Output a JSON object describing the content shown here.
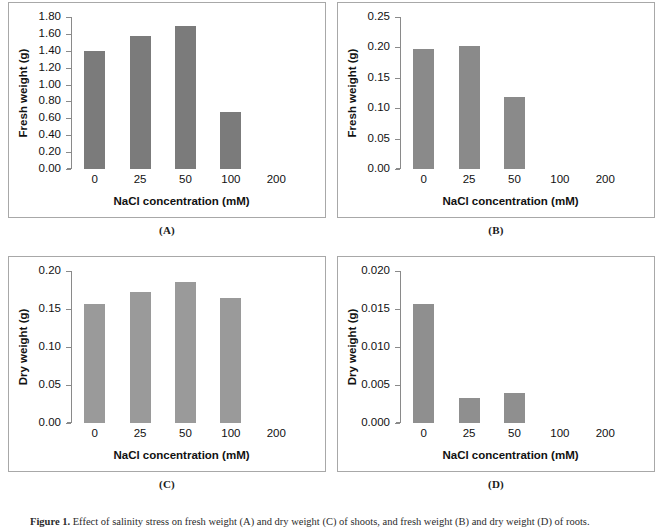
{
  "figure": {
    "caption_prefix": "Figure 1.",
    "caption_text": " Effect of salinity stress on fresh weight (A) and dry weight (C) of shoots, and fresh weight (B) and dry weight (D) of roots."
  },
  "common": {
    "xlabel": "NaCl concentration (mM)",
    "categories": [
      "0",
      "25",
      "50",
      "100",
      "200"
    ],
    "bar_color_dark": "#7b7b7b",
    "bar_color_light": "#9a9a9a",
    "axis_color": "#8a8a8a",
    "frame_color": "#a8a8a8"
  },
  "panels": [
    {
      "key": "A",
      "label": "(A)",
      "ylabel": "Fresh weight (g)",
      "yticks": [
        "0.00",
        "0.20",
        "0.40",
        "0.60",
        "0.80",
        "1.00",
        "1.20",
        "1.40",
        "1.60",
        "1.80"
      ],
      "ymin": 0,
      "ymax": 1.8,
      "bar_color": "#7b7b7b",
      "values": [
        1.4,
        1.58,
        1.69,
        0.68,
        null
      ]
    },
    {
      "key": "B",
      "label": "(B)",
      "ylabel": "Fresh weight (g)",
      "yticks": [
        "0.00",
        "0.05",
        "0.10",
        "0.15",
        "0.20",
        "0.25"
      ],
      "ymin": 0,
      "ymax": 0.25,
      "bar_color": "#8a8a8a",
      "values": [
        0.198,
        0.203,
        0.119,
        null,
        null
      ]
    },
    {
      "key": "C",
      "label": "(C)",
      "ylabel": "Dry weight (g)",
      "yticks": [
        "0.00",
        "0.05",
        "0.10",
        "0.15",
        "0.20"
      ],
      "ymin": 0,
      "ymax": 0.2,
      "bar_color": "#9a9a9a",
      "values": [
        0.156,
        0.172,
        0.186,
        0.165,
        null
      ]
    },
    {
      "key": "D",
      "label": "(D)",
      "ylabel": "Dry weight (g)",
      "yticks": [
        "0.000",
        "0.005",
        "0.010",
        "0.015",
        "0.020"
      ],
      "ymin": 0,
      "ymax": 0.02,
      "bar_color": "#8f8f8f",
      "values": [
        0.0156,
        0.0033,
        0.0039,
        null,
        null
      ]
    }
  ],
  "chart_data": [
    {
      "type": "bar",
      "panel": "A",
      "title": "(A)",
      "categories": [
        "0",
        "25",
        "50",
        "100",
        "200"
      ],
      "values": [
        1.4,
        1.58,
        1.69,
        0.68,
        null
      ],
      "xlabel": "NaCl concentration (mM)",
      "ylabel": "Fresh weight (g)",
      "ylim": [
        0,
        1.8
      ],
      "ytick_step": 0.2,
      "grid": false,
      "legend": "none"
    },
    {
      "type": "bar",
      "panel": "B",
      "title": "(B)",
      "categories": [
        "0",
        "25",
        "50",
        "100",
        "200"
      ],
      "values": [
        0.198,
        0.203,
        0.119,
        null,
        null
      ],
      "xlabel": "NaCl concentration (mM)",
      "ylabel": "Fresh weight (g)",
      "ylim": [
        0,
        0.25
      ],
      "ytick_step": 0.05,
      "grid": false,
      "legend": "none"
    },
    {
      "type": "bar",
      "panel": "C",
      "title": "(C)",
      "categories": [
        "0",
        "25",
        "50",
        "100",
        "200"
      ],
      "values": [
        0.156,
        0.172,
        0.186,
        0.165,
        null
      ],
      "xlabel": "NaCl concentration (mM)",
      "ylabel": "Dry weight (g)",
      "ylim": [
        0,
        0.2
      ],
      "ytick_step": 0.05,
      "grid": false,
      "legend": "none"
    },
    {
      "type": "bar",
      "panel": "D",
      "title": "(D)",
      "categories": [
        "0",
        "25",
        "50",
        "100",
        "200"
      ],
      "values": [
        0.0156,
        0.0033,
        0.0039,
        null,
        null
      ],
      "xlabel": "NaCl concentration (mM)",
      "ylabel": "Dry weight (g)",
      "ylim": [
        0,
        0.02
      ],
      "ytick_step": 0.005,
      "grid": false,
      "legend": "none"
    }
  ]
}
